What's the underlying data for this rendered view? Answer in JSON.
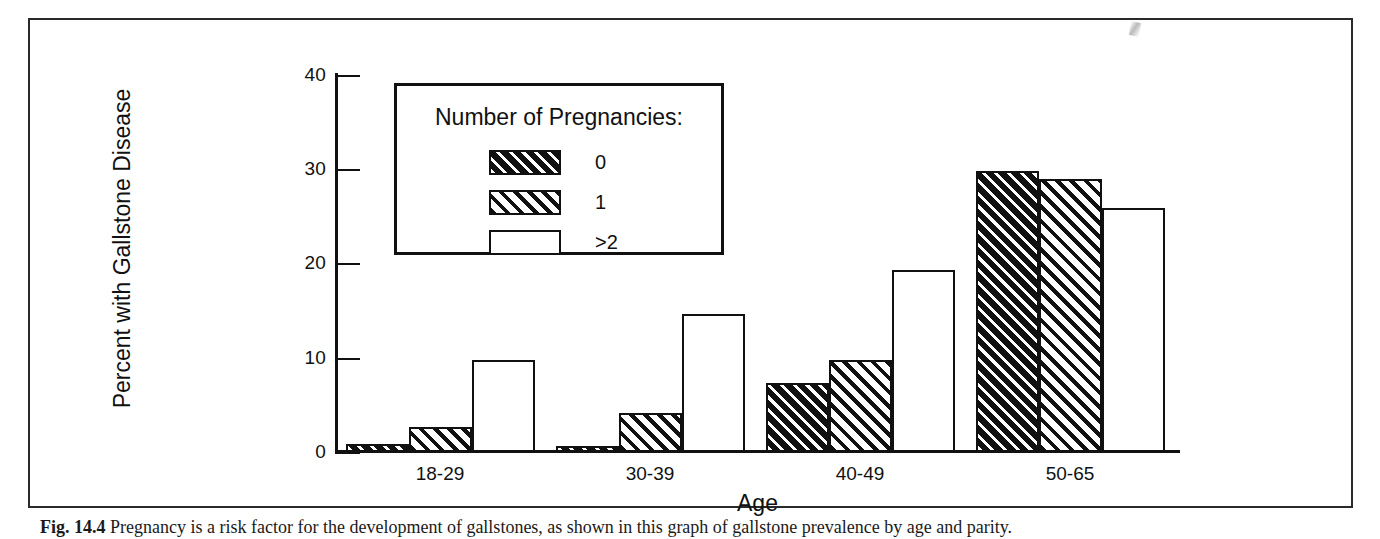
{
  "figure": {
    "caption_number": "Fig. 14.4",
    "caption_text": "Pregnancy is a risk factor for the development of gallstones, as shown in this graph of gallstone prevalence by age and parity."
  },
  "legend": {
    "title": "Number of Pregnancies:",
    "entries": [
      {
        "label": "0",
        "pattern": "black-with-white-diagonal-stripes"
      },
      {
        "label": "1",
        "pattern": "white-with-black-diagonal-stripes"
      },
      {
        "label": ">2",
        "pattern": "plain-white"
      }
    ]
  },
  "axes": {
    "y_title": "Percent with Gallstone Disease",
    "x_title": "Age",
    "y_ticks": [
      "0",
      "10",
      "20",
      "30",
      "40"
    ]
  },
  "chart_data": {
    "type": "bar",
    "title": "",
    "xlabel": "Age",
    "ylabel": "Percent with Gallstone Disease",
    "ylim": [
      0,
      40
    ],
    "yticks": [
      0,
      10,
      20,
      30,
      40
    ],
    "grid": false,
    "legend_title": "Number of Pregnancies:",
    "legend_position": "inside-upper-left",
    "categories": [
      "18-29",
      "30-39",
      "40-49",
      "50-65"
    ],
    "series": [
      {
        "name": "0",
        "values": [
          0.8,
          0.6,
          7.3,
          29.8
        ]
      },
      {
        "name": "1",
        "values": [
          2.7,
          4.1,
          9.8,
          29.0
        ]
      },
      {
        "name": ">2",
        "values": [
          9.8,
          14.6,
          19.3,
          25.9
        ]
      }
    ]
  }
}
